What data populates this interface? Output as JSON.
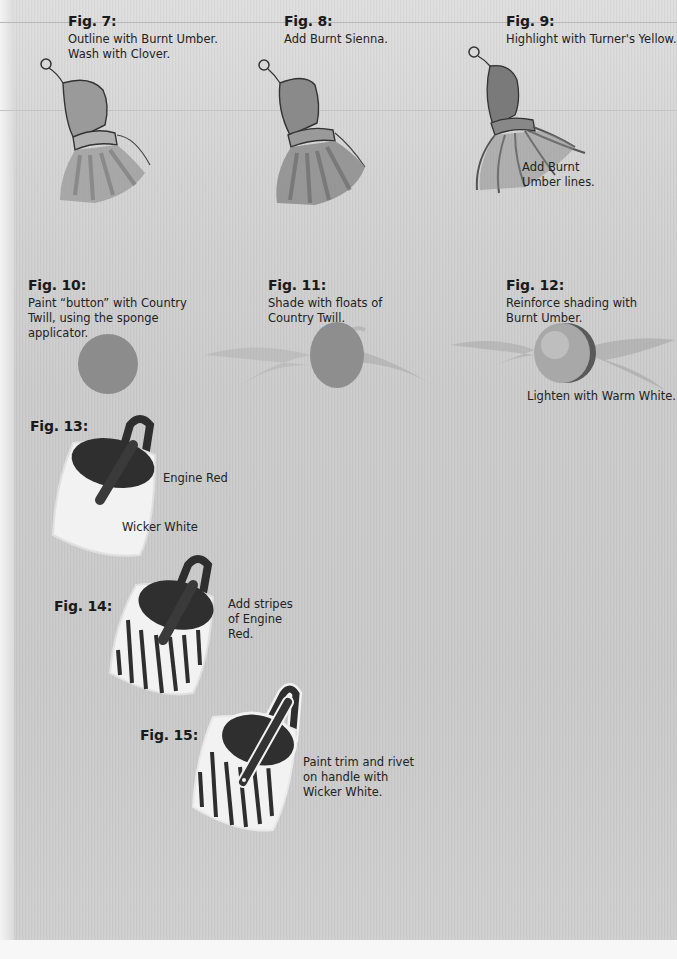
{
  "figures": [
    {
      "label": "Fig. 7:",
      "caption_lines": [
        "Outline with Burnt Umber.",
        "Wash with Clover."
      ]
    },
    {
      "label": "Fig. 8:",
      "caption_lines": [
        "Add Burnt Sienna."
      ]
    },
    {
      "label": "Fig. 9:",
      "caption_lines": [
        "Highlight with Turner's Yellow."
      ],
      "note_lines": [
        "Add Burnt",
        "Umber lines."
      ]
    },
    {
      "label": "Fig. 10:",
      "caption_lines": [
        "Paint “button” with Country",
        "Twill, using the sponge",
        "applicator."
      ]
    },
    {
      "label": "Fig. 11:",
      "caption_lines": [
        "Shade with floats of",
        "Country Twill."
      ]
    },
    {
      "label": "Fig. 12:",
      "caption_lines": [
        "Reinforce shading with",
        "Burnt Umber."
      ],
      "note_lines": [
        "Lighten with Warm White."
      ]
    },
    {
      "label": "Fig. 13:",
      "callouts": [
        "Engine Red",
        "Wicker White"
      ]
    },
    {
      "label": "Fig. 14:",
      "caption_lines": [
        "Add stripes",
        "of Engine",
        "Red."
      ]
    },
    {
      "label": "Fig. 15:",
      "caption_lines": [
        "Paint trim and rivet",
        "on handle with",
        "Wicker White."
      ]
    }
  ],
  "colors": {
    "background": "#cccccc",
    "ink": "#1a1a1a",
    "paint_dark": "#3a3a3a",
    "button_fill": "#8c8c8c",
    "bucket_white": "#f2f2f2"
  }
}
